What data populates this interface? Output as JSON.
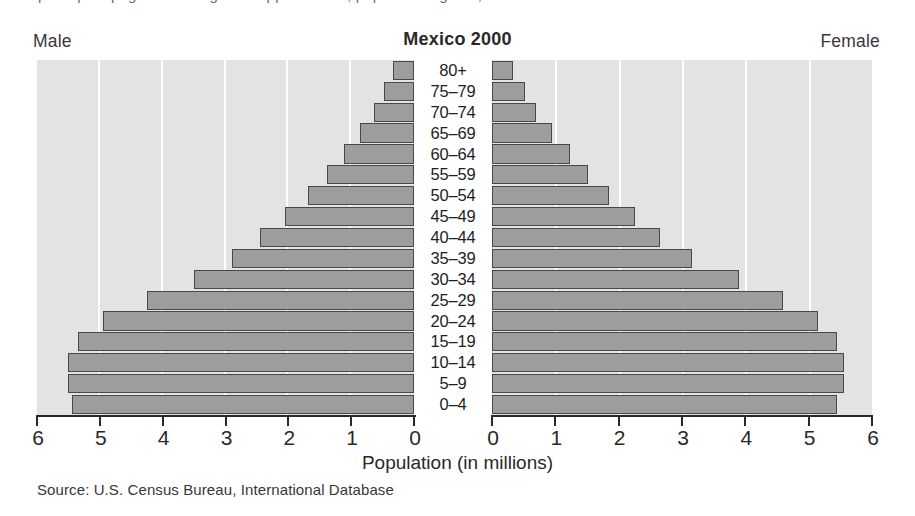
{
  "figure": {
    "top_bleed_text": "perhaps a page of running text clipped above, population figures,",
    "title": "Mexico 2000",
    "male_header": "Male",
    "female_header": "Female",
    "xlabel": "Population (in millions)",
    "source": "Source: U.S. Census Bureau, International Database",
    "colors": {
      "bar_fill": "#9d9d9d",
      "bar_stroke": "#4b4749",
      "plot_background": "#e3e3e3",
      "gridline": "#ffffff",
      "axis": "#2b2829",
      "text": "#231f20"
    }
  },
  "chart_data": {
    "type": "bar",
    "subtype": "population-pyramid",
    "title": "Mexico 2000",
    "xlabel": "Population (in millions)",
    "ylabel": "",
    "source": "Source: U.S. Census Bureau, International Database",
    "grid": true,
    "legend_position": "outside-top",
    "categories": [
      "80+",
      "75–79",
      "70–74",
      "65–69",
      "60–64",
      "55–59",
      "50–54",
      "45–49",
      "40–44",
      "35–39",
      "30–34",
      "25–29",
      "20–24",
      "15–19",
      "10–14",
      "5–9",
      "0–4"
    ],
    "series": [
      {
        "name": "Male",
        "side": "left",
        "axis_ticks": [
          6,
          5,
          4,
          3,
          2,
          1,
          0
        ],
        "xlim": [
          6,
          0
        ],
        "values": [
          0.33,
          0.47,
          0.63,
          0.86,
          1.12,
          1.38,
          1.68,
          2.05,
          2.45,
          2.9,
          3.5,
          4.25,
          4.95,
          5.35,
          5.5,
          5.5,
          5.45
        ]
      },
      {
        "name": "Female",
        "side": "right",
        "axis_ticks": [
          0,
          1,
          2,
          3,
          4,
          5,
          6
        ],
        "xlim": [
          0,
          6
        ],
        "values": [
          0.33,
          0.52,
          0.7,
          0.95,
          1.23,
          1.52,
          1.85,
          2.25,
          2.65,
          3.15,
          3.9,
          4.6,
          5.15,
          5.45,
          5.55,
          5.55,
          5.45
        ]
      }
    ]
  }
}
